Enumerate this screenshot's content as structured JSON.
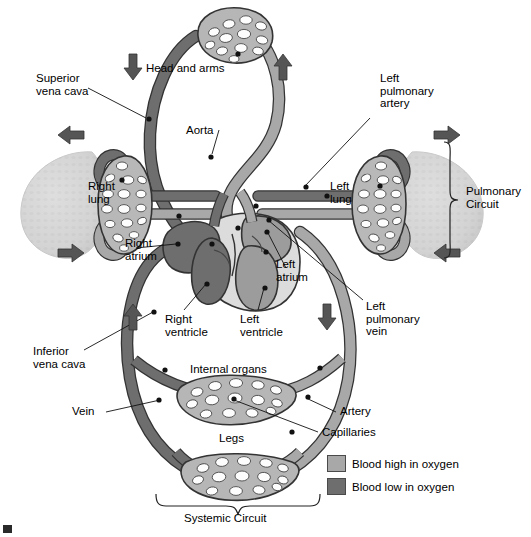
{
  "figure": {
    "background": "#ffffff"
  },
  "colors": {
    "oxygen_high": "#a8a8a8",
    "oxygen_low": "#6e6e6e",
    "heart_muscle": "#d8d8d8",
    "lung_body": "#d5d5d5",
    "outline": "#333333",
    "text": "#000000",
    "arrow": "#555555"
  },
  "labels": {
    "superior_vena_cava": "Superior\nvena cava",
    "head_and_arms": "Head and arms",
    "left_pulmonary_artery": "Left\npulmonary\nartery",
    "aorta": "Aorta",
    "right_lung": "Right\nlung",
    "left_lung": "Left\nlung",
    "pulmonary_circuit": "Pulmonary\nCircuit",
    "right_atrium": "Right\natrium",
    "left_atrium": "Left\natrium",
    "right_ventricle": "Right\nventricle",
    "left_ventricle": "Left\nventricle",
    "left_pulmonary_vein": "Left\npulmonary\nvein",
    "inferior_vena_cava": "Inferior\nvena cava",
    "internal_organs": "Internal organs",
    "vein": "Vein",
    "artery": "Artery",
    "capillaries": "Capillaries",
    "legs": "Legs",
    "systemic_circuit": "Systemic Circuit"
  },
  "legend": {
    "items": [
      {
        "label": "Blood high in oxygen",
        "swatch": "#a8a8a8"
      },
      {
        "label": "Blood low in oxygen",
        "swatch": "#6e6e6e"
      }
    ]
  },
  "flow_arrows": [
    {
      "name": "descending-head-arrow",
      "direction": "down",
      "x": 133,
      "y": 63
    },
    {
      "name": "ascending-head-arrow",
      "direction": "up",
      "x": 283,
      "y": 63
    },
    {
      "name": "right-lung-inflow-arrow",
      "direction": "left",
      "x": 71,
      "y": 135
    },
    {
      "name": "left-lung-inflow-arrow",
      "direction": "right",
      "x": 447,
      "y": 135
    },
    {
      "name": "right-lung-outflow-arrow",
      "direction": "right",
      "x": 71,
      "y": 253
    },
    {
      "name": "left-lung-outflow-arrow",
      "direction": "left",
      "x": 447,
      "y": 253
    },
    {
      "name": "inferior-vena-cava-arrow",
      "direction": "up",
      "x": 133,
      "y": 312
    },
    {
      "name": "descending-aorta-arrow",
      "direction": "down",
      "x": 327,
      "y": 312
    }
  ]
}
